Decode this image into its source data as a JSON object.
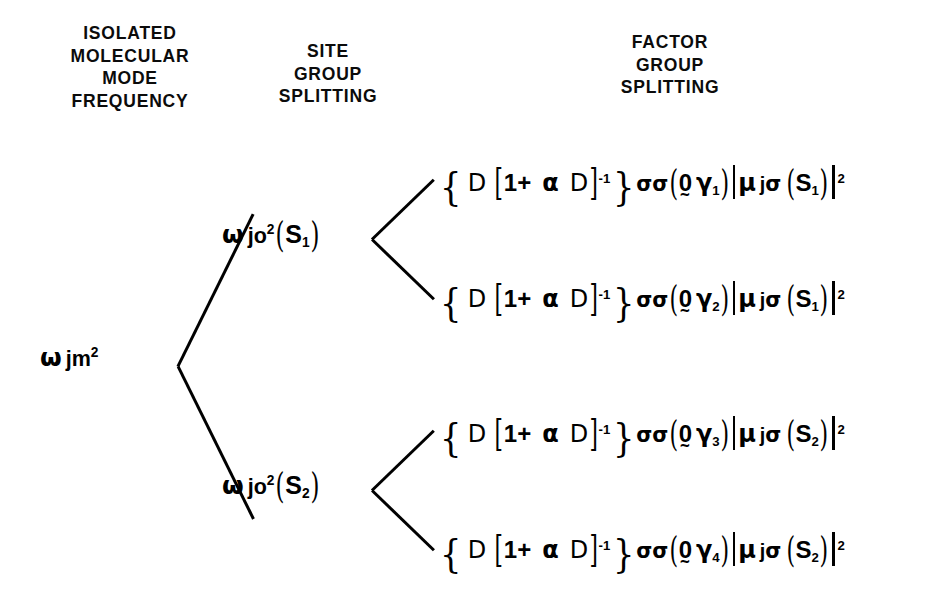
{
  "figure": {
    "type": "tree-diagram",
    "background_color": "#ffffff",
    "ink_color": "#000000",
    "width": 938,
    "height": 609
  },
  "headings": {
    "isolated": "ISOLATED\nMOLECULAR\nMODE\nFREQUENCY",
    "site": "SITE\nGROUP\nSPLITTING",
    "factor": "FACTOR\nGROUP\nSPLITTING"
  },
  "root": {
    "label": "ω_jm²",
    "omega": "ω",
    "sub": "jm",
    "sup": "2"
  },
  "site_nodes": [
    {
      "omega": "ω",
      "sub": "jo",
      "sup": "2",
      "arg_open": "(",
      "arg": "S",
      "arg_sub": "1",
      "arg_close": ")",
      "label": "ω_jo²(S1)"
    },
    {
      "omega": "ω",
      "sub": "jo",
      "sup": "2",
      "arg_open": "(",
      "arg": "S",
      "arg_sub": "2",
      "arg_close": ")",
      "label": "ω_jo²(S2)"
    }
  ],
  "factor_terms": [
    {
      "brace_open": "{",
      "D": "D",
      "brack_open": "[",
      "one_plus": "1+",
      "alpha": "α",
      "D2": "D",
      "brack_close": "]",
      "exp": "-1",
      "brace_close": "}",
      "sigma1": "σ",
      "sigma2": "σ",
      "paren_open": "(",
      "zero": "0",
      "gamma": "γ",
      "gamma_sub": "1",
      "paren_close": ")",
      "mu": "μ",
      "mu_sub": "j",
      "mu_sigma": "σ",
      "s_open": "(",
      "s": "S",
      "s_sub": "1",
      "s_close": ")",
      "modsq": "2",
      "label": "{D[1+ α D]^-1}σσ(0γ1)|μ_jσ(S1)|^2"
    },
    {
      "brace_open": "{",
      "D": "D",
      "brack_open": "[",
      "one_plus": "1+",
      "alpha": "α",
      "D2": "D",
      "brack_close": "]",
      "exp": "-1",
      "brace_close": "}",
      "sigma1": "σ",
      "sigma2": "σ",
      "paren_open": "(",
      "zero": "0",
      "gamma": "γ",
      "gamma_sub": "2",
      "paren_close": ")",
      "mu": "μ",
      "mu_sub": "j",
      "mu_sigma": "σ",
      "s_open": "(",
      "s": "S",
      "s_sub": "1",
      "s_close": ")",
      "modsq": "2",
      "label": "{D[1+ α D]^-1}σσ(0γ2)|μ_jσ(S1)|^2"
    },
    {
      "brace_open": "{",
      "D": "D",
      "brack_open": "[",
      "one_plus": "1+",
      "alpha": "α",
      "D2": "D",
      "brack_close": "]",
      "exp": "-1",
      "brace_close": "}",
      "sigma1": "σ",
      "sigma2": "σ",
      "paren_open": "(",
      "zero": "0",
      "gamma": "γ",
      "gamma_sub": "3",
      "paren_close": ")",
      "mu": "μ",
      "mu_sub": "j",
      "mu_sigma": "σ",
      "s_open": "(",
      "s": "S",
      "s_sub": "2",
      "s_close": ")",
      "modsq": "2",
      "label": "{D[1+ α D]^-1}σσ(0γ3)|μ_jσ(S2)|^2"
    },
    {
      "brace_open": "{",
      "D": "D",
      "brack_open": "[",
      "one_plus": "1+",
      "alpha": "α",
      "D2": "D",
      "brack_close": "]",
      "exp": "-1",
      "brace_close": "}",
      "sigma1": "σ",
      "sigma2": "σ",
      "paren_open": "(",
      "zero": "0",
      "gamma": "γ",
      "gamma_sub": "4",
      "paren_close": ")",
      "mu": "μ",
      "mu_sub": "j",
      "mu_sigma": "σ",
      "s_open": "(",
      "s": "S",
      "s_sub": "2",
      "s_close": ")",
      "modsq": "2",
      "label": "{D[1+ α D]^-1}σσ(0γ4)|μ_jσ(S2)|^2"
    }
  ]
}
